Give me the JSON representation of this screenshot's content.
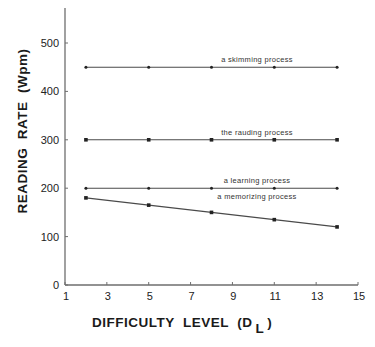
{
  "chart_data": {
    "type": "line",
    "title": "",
    "xlabel": "DIFFICULTY  LEVEL  (D",
    "xlabel_subscript": "L",
    "xlabel_close": ")",
    "ylabel": "READING  RATE  (Wpm)",
    "xlim": [
      1,
      15
    ],
    "ylim": [
      0,
      560
    ],
    "x_ticks": [
      1,
      3,
      5,
      7,
      9,
      11,
      13,
      15
    ],
    "y_ticks": [
      0,
      100,
      200,
      300,
      400,
      500
    ],
    "grid": false,
    "legend": "inline labels above each line",
    "x": [
      2,
      5,
      8,
      11,
      14
    ],
    "series": [
      {
        "name": "a skimming process",
        "values": [
          450,
          450,
          450,
          450,
          450
        ],
        "marker": "dot"
      },
      {
        "name": "the rauding process",
        "values": [
          300,
          300,
          300,
          300,
          300
        ],
        "marker": "square"
      },
      {
        "name": "a learning process",
        "values": [
          200,
          200,
          200,
          200,
          200
        ],
        "marker": "dot"
      },
      {
        "name": "a memorizing process",
        "values": [
          180,
          165,
          150,
          135,
          120
        ],
        "marker": "square"
      }
    ]
  },
  "colors": {
    "axis": "#6e6e6e",
    "line": "#4a4a4a",
    "marker": "#222222",
    "text": "#1a1a1a"
  }
}
